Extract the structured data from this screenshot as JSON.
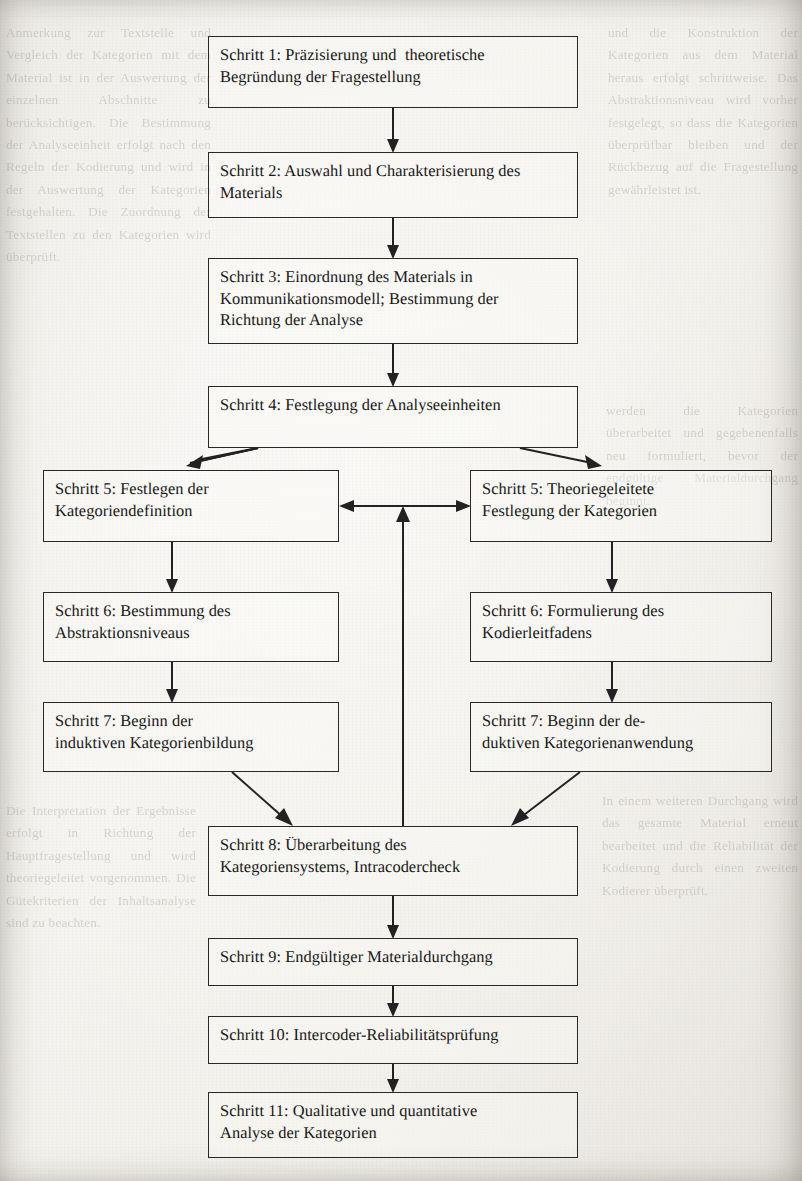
{
  "document": {
    "kind": "scanned-book-page",
    "language": "de",
    "figure_type": "flowchart",
    "background_color": "#f1efe9",
    "ink_color": "#1f1f1f"
  },
  "flowchart": {
    "title": "Allgemeines inhaltsanalytisches Ablaufmodell",
    "nodes": [
      {
        "id": "schritt-1",
        "lines": [
          "Schritt 1: Präzisierung und  theoretische",
          "Begründung der Fragestellung"
        ],
        "x": 208,
        "y": 36,
        "w": 370,
        "h": 72
      },
      {
        "id": "schritt-2",
        "lines": [
          "Schritt 2: Auswahl und Charakterisierung des",
          "Materials"
        ],
        "x": 208,
        "y": 152,
        "w": 370,
        "h": 66
      },
      {
        "id": "schritt-3",
        "lines": [
          "Schritt 3: Einordnung des Materials in",
          "Kommunikationsmodell; Bestimmung der",
          "Richtung der Analyse"
        ],
        "x": 208,
        "y": 258,
        "w": 370,
        "h": 86
      },
      {
        "id": "schritt-4",
        "lines": [
          "Schritt 4: Festlegung der Analyseeinheiten"
        ],
        "x": 208,
        "y": 386,
        "w": 370,
        "h": 62
      },
      {
        "id": "schritt-5-links",
        "lines": [
          "Schritt 5: Festlegen der",
          "Kategoriendefinition"
        ],
        "x": 43,
        "y": 470,
        "w": 296,
        "h": 72
      },
      {
        "id": "schritt-5-rechts",
        "lines": [
          "Schritt 5: Theoriegeleitete",
          "Festlegung der Kategorien"
        ],
        "x": 470,
        "y": 470,
        "w": 302,
        "h": 72
      },
      {
        "id": "schritt-6-links",
        "lines": [
          "Schritt 6: Bestimmung des",
          "Abstraktionsniveaus"
        ],
        "x": 43,
        "y": 592,
        "w": 296,
        "h": 70
      },
      {
        "id": "schritt-6-rechts",
        "lines": [
          "Schritt 6: Formulierung des",
          "Kodierleitfadens"
        ],
        "x": 470,
        "y": 592,
        "w": 302,
        "h": 70
      },
      {
        "id": "schritt-7-links",
        "lines": [
          "Schritt 7: Beginn der",
          "induktiven Kategorienbildung"
        ],
        "x": 43,
        "y": 702,
        "w": 296,
        "h": 70
      },
      {
        "id": "schritt-7-rechts",
        "lines": [
          "Schritt 7: Beginn der de-",
          "duktiven Kategorienanwendung"
        ],
        "x": 470,
        "y": 702,
        "w": 302,
        "h": 70
      },
      {
        "id": "schritt-8",
        "lines": [
          "Schritt 8: Überarbeitung des",
          "Kategoriensystems, Intracodercheck"
        ],
        "x": 208,
        "y": 826,
        "w": 370,
        "h": 70
      },
      {
        "id": "schritt-9",
        "lines": [
          "Schritt 9: Endgültiger Materialdurchgang"
        ],
        "x": 208,
        "y": 938,
        "w": 370,
        "h": 48
      },
      {
        "id": "schritt-10",
        "lines": [
          "Schritt 10: Intercoder-Reliabilitätsprüfung"
        ],
        "x": 208,
        "y": 1016,
        "w": 370,
        "h": 48
      },
      {
        "id": "schritt-11",
        "lines": [
          "Schritt 11: Qualitative und quantitative",
          "Analyse der Kategorien"
        ],
        "x": 208,
        "y": 1092,
        "w": 370,
        "h": 66
      }
    ],
    "connections": [
      {
        "from": "schritt-1",
        "to": "schritt-2",
        "style": "straight-down"
      },
      {
        "from": "schritt-2",
        "to": "schritt-3",
        "style": "straight-down"
      },
      {
        "from": "schritt-3",
        "to": "schritt-4",
        "style": "straight-down"
      },
      {
        "from": "schritt-4",
        "to": "schritt-5-links",
        "style": "diagonal-left"
      },
      {
        "from": "schritt-4",
        "to": "schritt-5-rechts",
        "style": "diagonal-right"
      },
      {
        "from": "schritt-5-links",
        "to": "schritt-5-rechts",
        "style": "bidirectional-horizontal"
      },
      {
        "from": "schritt-5-links",
        "to": "schritt-6-links",
        "style": "straight-down"
      },
      {
        "from": "schritt-5-rechts",
        "to": "schritt-6-rechts",
        "style": "straight-down"
      },
      {
        "from": "schritt-6-links",
        "to": "schritt-7-links",
        "style": "straight-down"
      },
      {
        "from": "schritt-6-rechts",
        "to": "schritt-7-rechts",
        "style": "straight-down"
      },
      {
        "from": "schritt-7-links",
        "to": "schritt-8",
        "style": "diagonal-right-down"
      },
      {
        "from": "schritt-7-rechts",
        "to": "schritt-8",
        "style": "diagonal-left-down"
      },
      {
        "from": "schritt-8",
        "to": "schritt-5-junction",
        "style": "feedback-up"
      },
      {
        "from": "schritt-8",
        "to": "schritt-9",
        "style": "straight-down"
      },
      {
        "from": "schritt-9",
        "to": "schritt-10",
        "style": "straight-down"
      },
      {
        "from": "schritt-10",
        "to": "schritt-11",
        "style": "straight-down"
      }
    ]
  },
  "bleed_through": {
    "note": "faint mirrored text showing through from the reverse side of the page",
    "left_column": "Anmerkung zur Textstelle und Vergleich der Kategorien mit dem Material ist in der Auswertung der einzelnen Abschnitte zu berücksichtigen. Die Bestimmung der Analyseeinheit erfolgt nach den Regeln der Kodierung und wird in der Auswertung der Kategorien festgehalten. Die Zuordnung der Textstellen zu den Kategorien wird überprüft.",
    "right_column": "und die Konstruktion der Kategorien aus dem Material heraus erfolgt schrittweise. Das Abstraktionsniveau wird vorher festgelegt, so dass die Kategorien überprüfbar bleiben und der Rückbezug auf die Fragestellung gewährleistet ist.",
    "lower_left": "Die Interpretation der Ergebnisse erfolgt in Richtung der Hauptfragestellung und wird theoriegeleitet vorgenommen. Die Gütekriterien der Inhaltsanalyse sind zu beachten.",
    "lower_right": "In einem weiteren Durchgang wird das gesamte Material erneut bearbeitet und die Reliabilität der Kodierung durch einen zweiten Kodierer überprüft.",
    "mid_right": "werden die Kategorien überarbeitet und gegebenenfalls neu formuliert, bevor der endgültige Materialdurchgang beginnt."
  }
}
